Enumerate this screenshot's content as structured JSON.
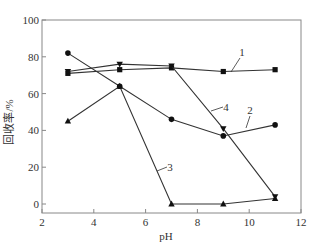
{
  "chart_data": {
    "type": "line",
    "title": "",
    "xlabel": "pH",
    "ylabel": "回收率/%",
    "xlim": [
      2,
      12
    ],
    "ylim": [
      0,
      100
    ],
    "xticks": [
      2,
      4,
      6,
      8,
      10,
      12
    ],
    "yticks": [
      0,
      20,
      40,
      60,
      80,
      100
    ],
    "grid": false,
    "legend": "inline numeric labels",
    "x": [
      3,
      5,
      7,
      9,
      11
    ],
    "series": [
      {
        "name": "1",
        "marker": "square",
        "values": [
          71,
          73,
          74,
          72,
          73
        ]
      },
      {
        "name": "2",
        "marker": "circle",
        "values": [
          82,
          64,
          46,
          37,
          43
        ]
      },
      {
        "name": "3",
        "marker": "triangle-up",
        "values": [
          45,
          64,
          0,
          0,
          3
        ]
      },
      {
        "name": "4",
        "marker": "triangle-down",
        "values": [
          72,
          76,
          75,
          41,
          4
        ]
      }
    ],
    "annotations": [
      {
        "text": "1",
        "x": 242,
        "y": 56,
        "lx1": 240,
        "ly1": 58,
        "lx2": 231,
        "ly2": 72
      },
      {
        "text": "4",
        "x": 226,
        "y": 111,
        "lx1": 223,
        "ly1": 107,
        "lx2": 211,
        "ly2": 111
      },
      {
        "text": "2",
        "x": 250,
        "y": 114,
        "lx1": 250,
        "ly1": 116,
        "lx2": 246,
        "ly2": 128
      },
      {
        "text": "3",
        "x": 170,
        "y": 171,
        "lx1": 167,
        "ly1": 167,
        "lx2": 157,
        "ly2": 171
      }
    ]
  },
  "colors": {
    "line": "#333333",
    "axis": "#888888",
    "background": "#ffffff"
  }
}
